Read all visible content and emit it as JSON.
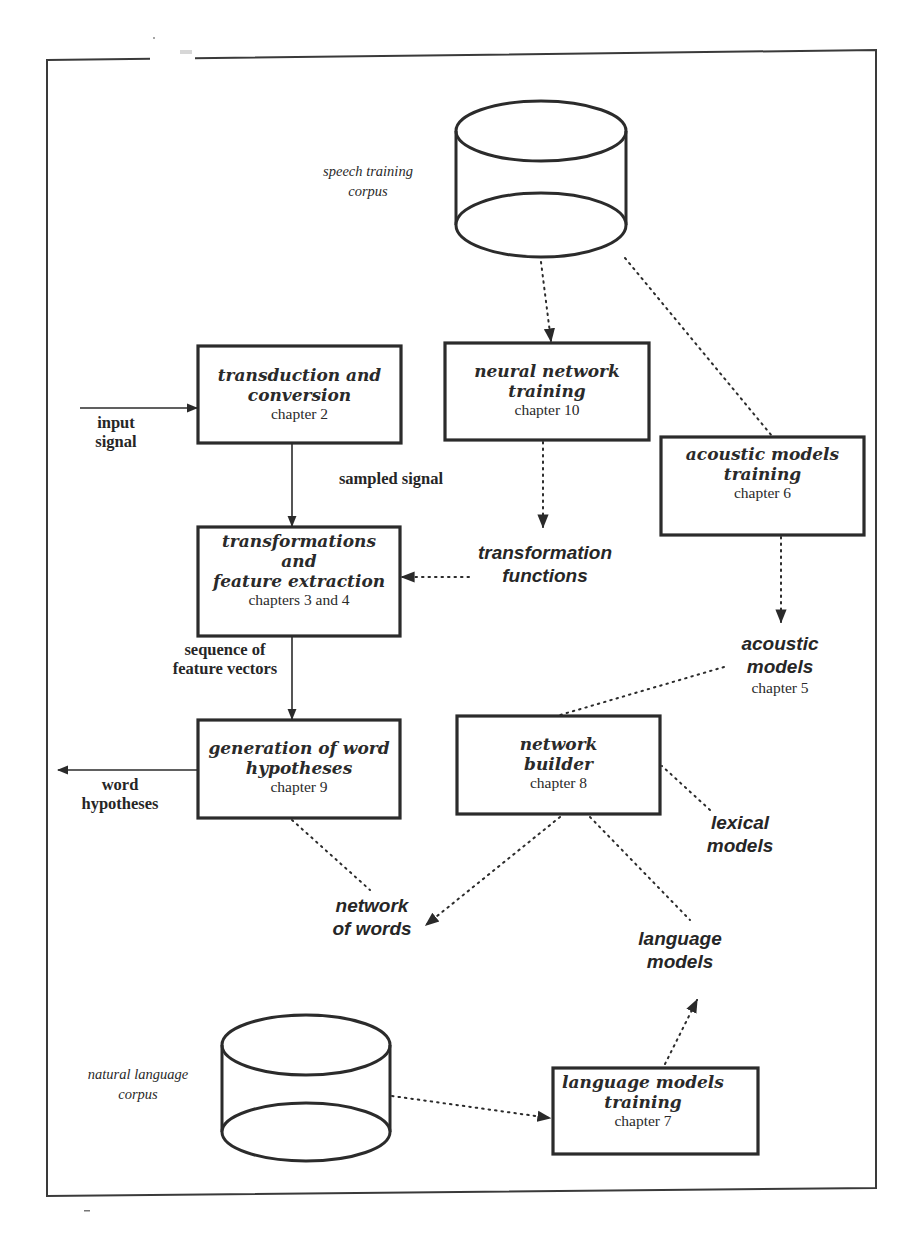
{
  "diagram": {
    "type": "speech-recognition-system-architecture",
    "stores": [
      {
        "id": "speech_corpus",
        "label_line1": "speech training",
        "label_line2": "corpus"
      },
      {
        "id": "nl_corpus",
        "label_line1": "natural language",
        "label_line2": "corpus"
      }
    ],
    "boxes": {
      "transduction": {
        "title1": "transduction and",
        "title2": "conversion",
        "chapter": "chapter 2"
      },
      "neural": {
        "title1": "neural network",
        "title2": "training",
        "chapter": "chapter 10"
      },
      "acoustic_training": {
        "title1": "acoustic models",
        "title2": "training",
        "chapter": "chapter 6"
      },
      "transformations": {
        "title1": "transformations",
        "title2": "and",
        "title3": "feature extraction",
        "chapter": "chapters 3 and 4"
      },
      "generation": {
        "title1": "generation of word",
        "title2": "hypotheses",
        "chapter": "chapter 9"
      },
      "network_builder": {
        "title1": "network",
        "title2": "builder",
        "chapter": "chapter 8"
      },
      "lm_training": {
        "title1": "language models",
        "title2": "training",
        "chapter": "chapter 7"
      }
    },
    "edge_labels": {
      "input_signal": {
        "line1": "input",
        "line2": "signal"
      },
      "sampled_signal": {
        "line1": "sampled signal"
      },
      "feature_vectors": {
        "line1": "sequence of",
        "line2": "feature vectors"
      },
      "word_hypotheses": {
        "line1": "word",
        "line2": "hypotheses"
      }
    },
    "data_items": {
      "transformation_functions": {
        "line1": "transformation",
        "line2": "functions"
      },
      "acoustic_models": {
        "line1": "acoustic",
        "line2": "models",
        "chapter": "chapter 5"
      },
      "lexical_models": {
        "line1": "lexical",
        "line2": "models"
      },
      "network_of_words": {
        "line1": "network",
        "line2": "of words"
      },
      "language_models": {
        "line1": "language",
        "line2": "models"
      }
    },
    "connections": [
      {
        "from": "input_signal",
        "to": "transduction",
        "style": "solid"
      },
      {
        "from": "transduction",
        "to": "transformations",
        "style": "solid",
        "label": "sampled signal"
      },
      {
        "from": "transformations",
        "to": "generation",
        "style": "solid",
        "label": "sequence of feature vectors"
      },
      {
        "from": "generation",
        "to": "word_hypotheses",
        "style": "solid"
      },
      {
        "from": "speech_corpus",
        "to": "neural",
        "style": "dotted"
      },
      {
        "from": "speech_corpus",
        "to": "acoustic_training",
        "style": "dotted"
      },
      {
        "from": "neural",
        "to": "transformation_functions",
        "style": "dotted"
      },
      {
        "from": "transformation_functions",
        "to": "transformations",
        "style": "dotted"
      },
      {
        "from": "acoustic_training",
        "to": "acoustic_models",
        "style": "dotted"
      },
      {
        "from": "acoustic_models",
        "to": "network_builder",
        "style": "dotted"
      },
      {
        "from": "lexical_models",
        "to": "network_builder",
        "style": "dotted"
      },
      {
        "from": "language_models",
        "to": "network_builder",
        "style": "dotted"
      },
      {
        "from": "network_builder",
        "to": "network_of_words",
        "style": "dotted"
      },
      {
        "from": "network_of_words",
        "to": "generation",
        "style": "dotted"
      },
      {
        "from": "nl_corpus",
        "to": "lm_training",
        "style": "dotted"
      },
      {
        "from": "lm_training",
        "to": "language_models",
        "style": "dotted"
      }
    ]
  }
}
